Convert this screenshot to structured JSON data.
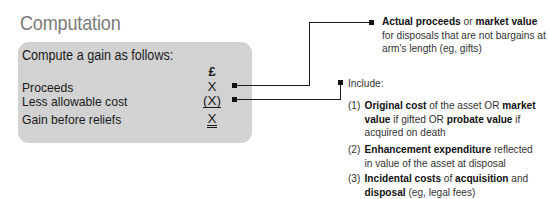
{
  "title": "Computation",
  "box": {
    "heading": "Compute a gain as follows:",
    "currency_symbol": "£",
    "rows": [
      {
        "label": "Proceeds",
        "value": "X"
      },
      {
        "label": "Less allowable cost",
        "value": "(X)"
      },
      {
        "label": "Gain before reliefs",
        "value": "X"
      }
    ]
  },
  "notes": {
    "proceeds": {
      "bold1": "Actual proceeds",
      "text1": " or ",
      "bold2": "market value",
      "text2": "for disposals that are not bargains at arm's length (eg, gifts)"
    },
    "cost": {
      "intro": "Include:",
      "items": [
        {
          "num": "(1)",
          "b1": "Original cost",
          "t1": " of the asset OR ",
          "b2": "market value",
          "t2": " if gifted OR ",
          "b3": "probate value",
          "t3": " if acquired on death"
        },
        {
          "num": "(2)",
          "b1": "Enhancement expenditure",
          "t1": " reflected in value of the asset at disposal"
        },
        {
          "num": "(3)",
          "b1": "Incidental costs",
          "t1": " of ",
          "b2": "acquisition",
          "t2": " and ",
          "b3": "disposal",
          "t3": " (eg, legal fees)"
        }
      ]
    }
  },
  "colors": {
    "box_background": "#d2d2d2",
    "title": "#7a7a7a",
    "connector": "#1a1a1a"
  }
}
